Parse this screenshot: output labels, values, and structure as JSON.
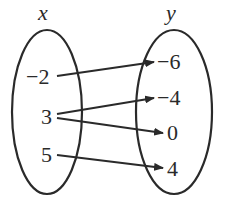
{
  "diagram": {
    "type": "mapping-diagram",
    "colors": {
      "stroke": "#2a2a2a",
      "background": "#ffffff"
    },
    "domain_set": {
      "label": "x",
      "values": [
        "−2",
        "3",
        "5"
      ]
    },
    "range_set": {
      "label": "y",
      "values": [
        "−6",
        "−4",
        "0",
        "4"
      ]
    },
    "mappings": [
      {
        "from": "−2",
        "to": "−6"
      },
      {
        "from": "3",
        "to": "−4"
      },
      {
        "from": "3",
        "to": "0"
      },
      {
        "from": "5",
        "to": "4"
      }
    ]
  }
}
